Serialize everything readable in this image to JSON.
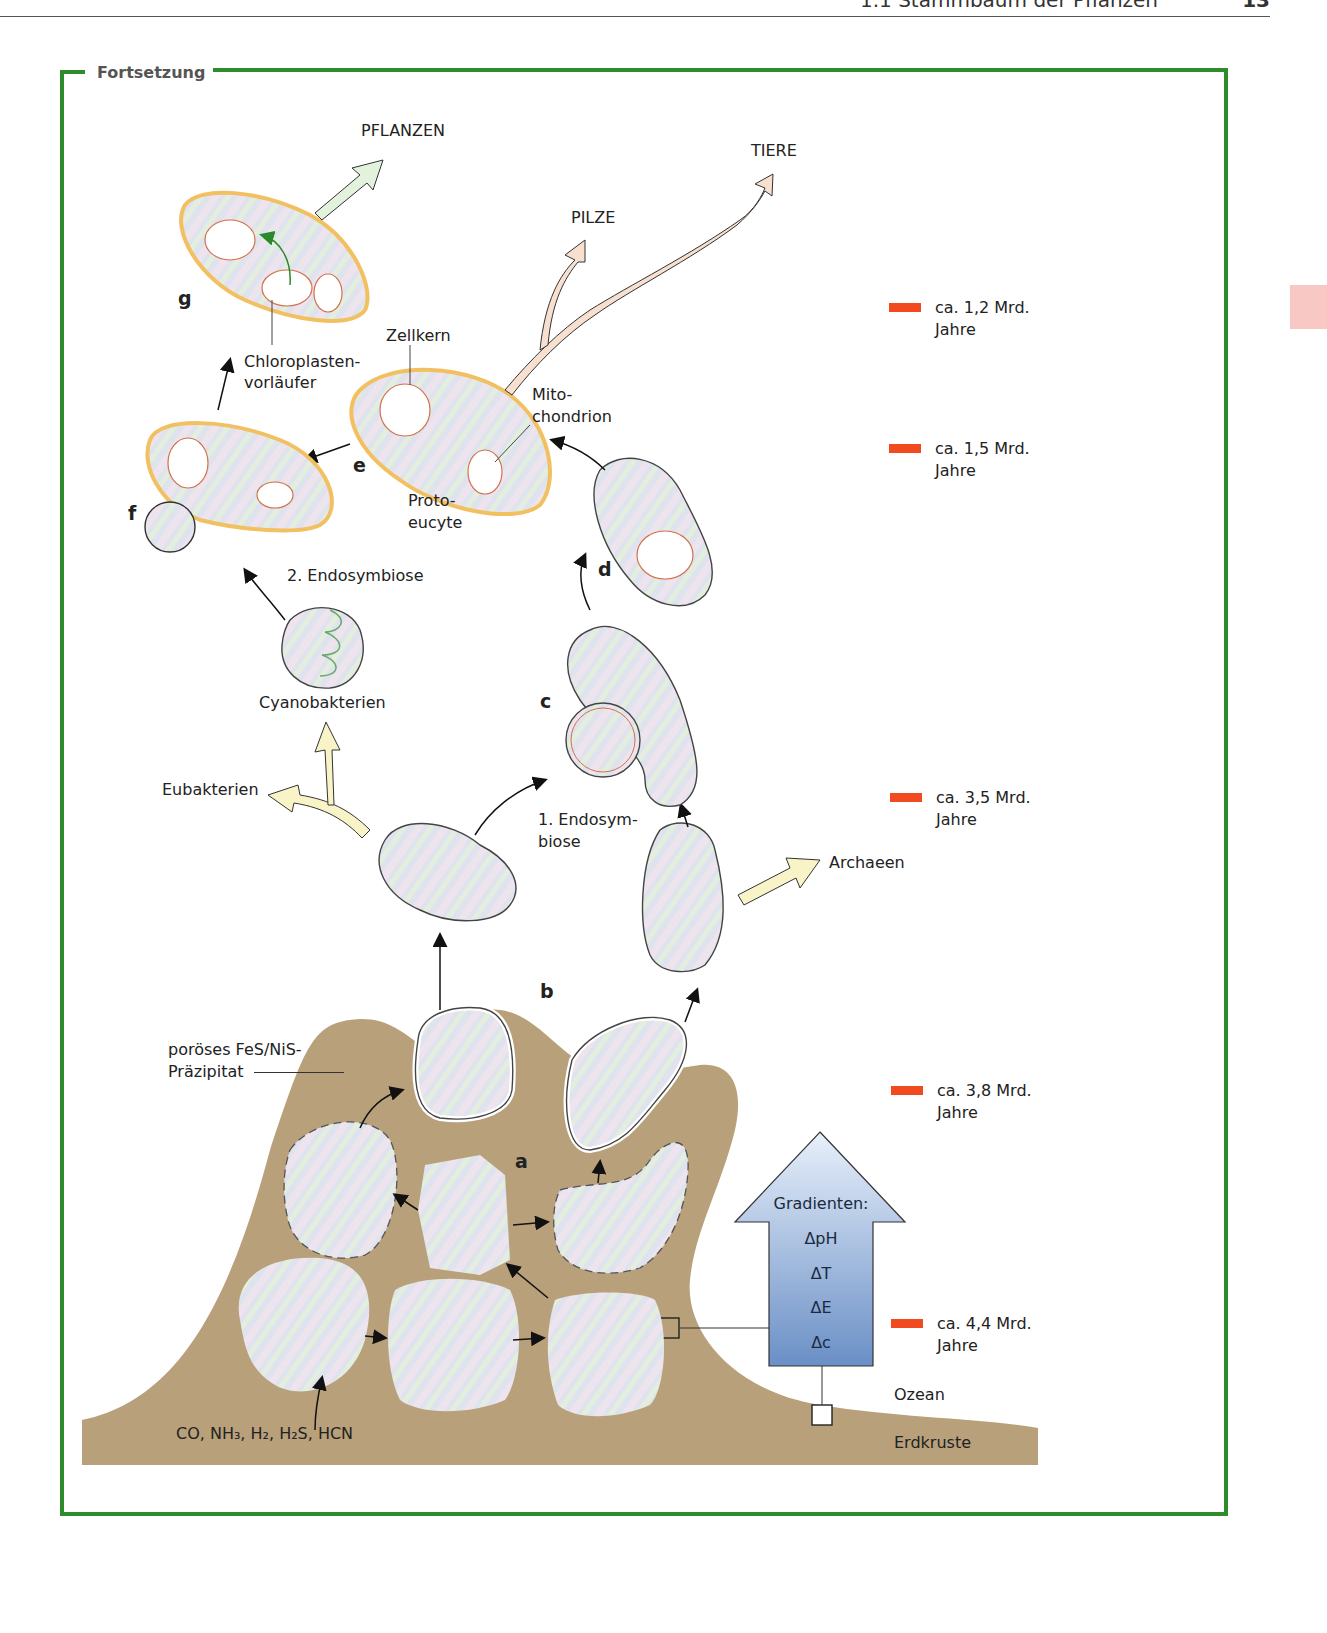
{
  "header": {
    "section": "1.1  Stammbaum der Pflanzen",
    "page": "13"
  },
  "box": {
    "title": "Fortsetzung"
  },
  "lineages": {
    "plants": "PFLANZEN",
    "animals": "TIERE",
    "fungi": "PILZE",
    "eubacteria": "Eubakterien",
    "archaea": "Archaeen",
    "cyanobacteria": "Cyanobakterien"
  },
  "labels": {
    "nucleus": "Zellkern",
    "chloroplast_1": "Chloroplasten-",
    "chloroplast_2": "vorläufer",
    "mito_1": "Mito-",
    "mito_2": "chondrion",
    "proto_1": "Proto-",
    "proto_2": "eucyte",
    "endo2": "2. Endosymbiose",
    "endo1_1": "1. Endosym-",
    "endo1_2": "biose",
    "precip_1": "poröses FeS/NiS-",
    "precip_2": "Präzipitat",
    "gases": "CO, NH₃, H₂, H₂S, HCN",
    "ocean": "Ozean",
    "crust": "Erdkruste"
  },
  "stage_letters": [
    "a",
    "b",
    "c",
    "d",
    "e",
    "f",
    "g"
  ],
  "gradients": {
    "title": "Gradienten:",
    "items": [
      "ΔpH",
      "ΔT",
      "ΔE",
      "Δc"
    ]
  },
  "timeline": [
    {
      "value": "ca. 1,2 Mrd.",
      "unit": "Jahre"
    },
    {
      "value": "ca. 1,5 Mrd.",
      "unit": "Jahre"
    },
    {
      "value": "ca. 3,5 Mrd.",
      "unit": "Jahre"
    },
    {
      "value": "ca. 3,8 Mrd.",
      "unit": "Jahre"
    },
    {
      "value": "ca. 4,4 Mrd.",
      "unit": "Jahre"
    }
  ],
  "colors": {
    "frame": "#2e8b2e",
    "timeline_bar": "#f04a1e",
    "rock": "#b8a07a",
    "cell_fill": "#dfe3ee",
    "eukaryote_wall": "#f2c060",
    "plant_arrow": "#e2f2dc",
    "animal_arrow": "#f8e0d0",
    "bacteria_arrow": "#f8f4c8",
    "gradient_top": "#e4eef9",
    "gradient_bottom": "#6a8fc6"
  }
}
